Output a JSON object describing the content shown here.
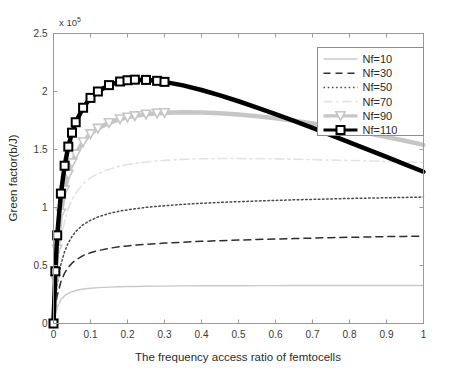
{
  "chart_data": {
    "type": "line",
    "title": "",
    "xlabel": "The frequency access ratio of femtocells",
    "ylabel": "Green factor(b/J)",
    "y_exponent_label": "x 10",
    "y_exponent_power": "5",
    "y_scale": 100000,
    "xlim": [
      0,
      1
    ],
    "ylim": [
      0,
      250000
    ],
    "grid": false,
    "legend_position": "upper right",
    "xticks": [
      0,
      0.1,
      0.2,
      0.3,
      0.4,
      0.5,
      0.6,
      0.7,
      0.8,
      0.9,
      1
    ],
    "xticklabels": [
      "0",
      "0.1",
      "0.2",
      "0.3",
      "0.4",
      "0.5",
      "0.6",
      "0.7",
      "0.8",
      "0.9",
      "1"
    ],
    "yticks": [
      0,
      50000,
      100000,
      150000,
      200000,
      250000
    ],
    "yticklabels": [
      "0",
      "0.5",
      "1",
      "1.5",
      "2",
      "2.5"
    ],
    "x": [
      0,
      0.005,
      0.01,
      0.02,
      0.03,
      0.04,
      0.05,
      0.06,
      0.08,
      0.1,
      0.12,
      0.15,
      0.18,
      0.2,
      0.22,
      0.25,
      0.28,
      0.3,
      0.35,
      0.4,
      0.45,
      0.5,
      0.55,
      0.6,
      0.65,
      0.7,
      0.75,
      0.8,
      0.85,
      0.9,
      0.95,
      1
    ],
    "series": [
      {
        "name": "Nf=10",
        "label": "Nf=10",
        "linestyle": "solid",
        "marker": "none",
        "color": "#c9c9c9",
        "width": 1.4,
        "values": [
          0,
          8000,
          14000,
          20500,
          24000,
          26000,
          27400,
          28400,
          29700,
          30400,
          30900,
          31400,
          31700,
          31850,
          31950,
          32100,
          32200,
          32250,
          32400,
          32500,
          32560,
          32600,
          32640,
          32670,
          32700,
          32720,
          32740,
          32760,
          32780,
          32790,
          32800,
          32810
        ]
      },
      {
        "name": "Nf=30",
        "label": "Nf=30",
        "linestyle": "dashed",
        "marker": "none",
        "color": "#2e2e2e",
        "width": 1.5,
        "values": [
          0,
          14000,
          24000,
          36000,
          43500,
          48500,
          52000,
          54800,
          58600,
          61000,
          62800,
          64800,
          66200,
          66900,
          67500,
          68300,
          68900,
          69300,
          70100,
          70800,
          71400,
          71900,
          72400,
          72800,
          73200,
          73600,
          74000,
          74300,
          74600,
          74900,
          75100,
          75400
        ]
      },
      {
        "name": "Nf=50",
        "label": "Nf=50",
        "linestyle": "dotted",
        "marker": "none",
        "color": "#4a4a4a",
        "width": 1.5,
        "values": [
          0,
          20000,
          34000,
          51000,
          62000,
          69500,
          75000,
          79200,
          85200,
          89000,
          91800,
          94800,
          97000,
          98000,
          98900,
          100100,
          101000,
          101500,
          102700,
          103600,
          104400,
          105000,
          105600,
          106100,
          106600,
          107000,
          107400,
          107800,
          108100,
          108400,
          108700,
          109000
        ]
      },
      {
        "name": "Nf=70",
        "label": "Nf=70",
        "linestyle": "dashdot-light",
        "marker": "none",
        "color": "#e3e3e3",
        "width": 1.6,
        "values": [
          0,
          29000,
          49000,
          73000,
          88500,
          99000,
          106500,
          112300,
          120400,
          125600,
          129200,
          133000,
          135800,
          137000,
          138000,
          139200,
          140100,
          140600,
          141500,
          142000,
          142200,
          142200,
          142100,
          141900,
          141600,
          141300,
          140900,
          140500,
          140100,
          139700,
          139300,
          138900
        ]
      },
      {
        "name": "Nf=90",
        "label": "Nf=90",
        "linestyle": "solid",
        "marker": "triangle-down",
        "color": "#c6c6c6",
        "width": 4.5,
        "values": [
          0,
          38000,
          64000,
          95000,
          115000,
          128500,
          138500,
          146000,
          156500,
          163500,
          168200,
          173000,
          176300,
          177800,
          179000,
          180400,
          181300,
          181700,
          182200,
          182000,
          181300,
          180200,
          178700,
          176900,
          174800,
          172400,
          169800,
          167000,
          164000,
          160800,
          157500,
          154000
        ]
      },
      {
        "name": "Nf=110",
        "label": "Nf=110",
        "linestyle": "solid",
        "marker": "square",
        "color": "#000000",
        "width": 4.5,
        "values": [
          0,
          45000,
          76000,
          112000,
          136000,
          152500,
          164500,
          173500,
          186000,
          194500,
          200000,
          205500,
          208600,
          209700,
          210200,
          210000,
          209200,
          208300,
          205300,
          201300,
          196700,
          191600,
          186200,
          180500,
          174600,
          168600,
          162400,
          156200,
          149900,
          143600,
          137200,
          130800
        ]
      }
    ]
  },
  "legend": {
    "entries": [
      "Nf=10",
      "Nf=30",
      "Nf=50",
      "Nf=70",
      "Nf=90",
      "Nf=110"
    ]
  }
}
